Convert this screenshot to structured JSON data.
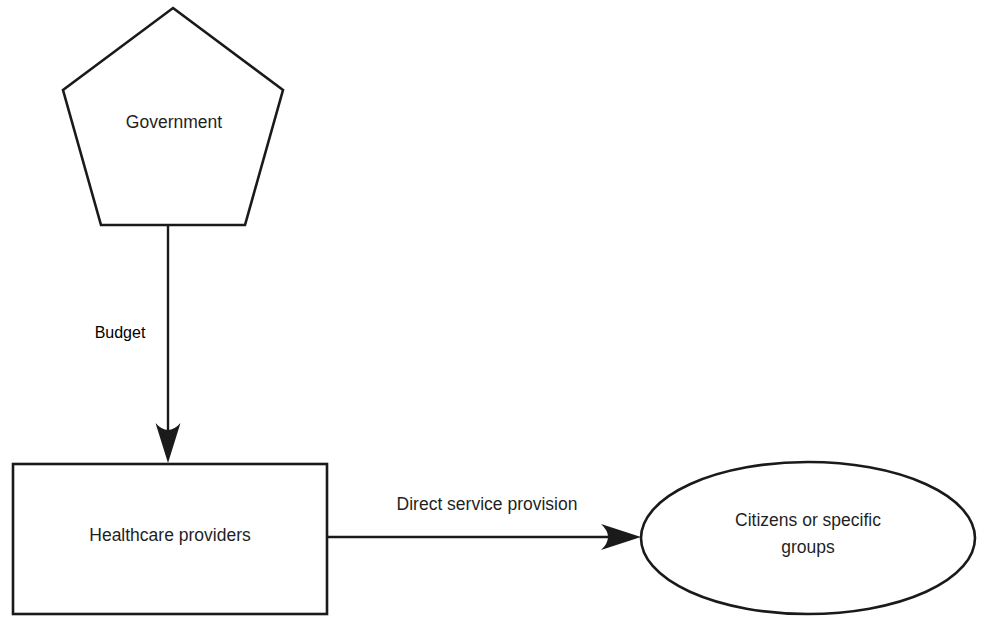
{
  "diagram": {
    "background_color": "#ffffff",
    "stroke_color": "#1a1a1a",
    "text_color": "#1f1f1f",
    "nodes": [
      {
        "id": "government",
        "shape": "pentagon",
        "label": "Government"
      },
      {
        "id": "healthcare-providers",
        "shape": "rectangle",
        "label": "Healthcare providers"
      },
      {
        "id": "citizens",
        "shape": "ellipse",
        "label_line1": "Citizens or specific",
        "label_line2": "groups"
      }
    ],
    "edges": [
      {
        "id": "government-to-providers",
        "label": "Budget",
        "direction": "down",
        "from": "government",
        "to": "healthcare-providers"
      },
      {
        "id": "providers-to-citizens",
        "label": "Direct service provision",
        "direction": "right",
        "from": "healthcare-providers",
        "to": "citizens"
      }
    ]
  }
}
